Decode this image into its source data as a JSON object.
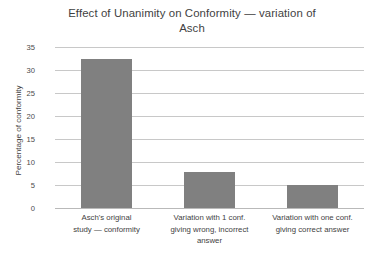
{
  "chart_data": {
    "type": "bar",
    "title": "Effect of Unanimity on Conformity — variation of Asch",
    "title_line1": "Effect of Unanimity on Conformity — variation of",
    "title_line2": "Asch",
    "xlabel": "",
    "ylabel": "Percentage of conformity",
    "ylim": [
      0,
      35
    ],
    "ytick_labels": [
      "35",
      "30",
      "25",
      "20",
      "15",
      "10",
      "5",
      "0"
    ],
    "yticks": [
      35,
      30,
      25,
      20,
      15,
      10,
      5,
      0
    ],
    "grid": true,
    "legend": "none",
    "bar_color": "#808080",
    "gridline_color": "#c8c8c8",
    "background": "#ffffff",
    "categories": [
      "Asch's original study — conformity",
      "Variation with 1 conf. giving wrong, incorrect answer",
      "Variation with one conf. giving correct answer"
    ],
    "category_lines": [
      [
        "Asch's original",
        "study — conformity"
      ],
      [
        "Variation with 1 conf.",
        "giving wrong, incorrect",
        "answer"
      ],
      [
        "Variation with one conf.",
        "giving correct answer"
      ]
    ],
    "values": [
      32.5,
      7.8,
      5.0
    ]
  }
}
